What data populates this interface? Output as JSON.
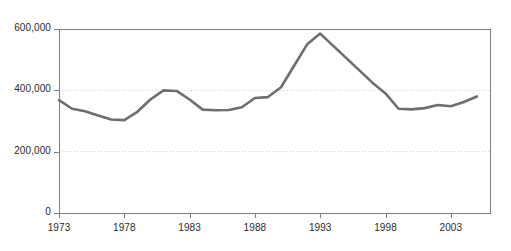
{
  "chart_data": {
    "type": "line",
    "title": "",
    "subtitle": "",
    "xlabel": "",
    "ylabel": "",
    "xlim": [
      1973,
      2006
    ],
    "ylim": [
      0,
      600000
    ],
    "grid": "horizontal-dotted",
    "legend": "none",
    "line_color": "#6e6e6e",
    "axis_color": "#808080",
    "gridline_color": "#cfcfcf",
    "xticks": [
      1973,
      1978,
      1983,
      1988,
      1993,
      1998,
      2003
    ],
    "xtick_labels": [
      "1973",
      "1978",
      "1983",
      "1988",
      "1993",
      "1998",
      "2003"
    ],
    "yticks": [
      0,
      200000,
      400000,
      600000
    ],
    "ytick_labels": [
      "0",
      "200,000",
      "400,000",
      "600,000"
    ],
    "x": [
      1973,
      1974,
      1975,
      1976,
      1977,
      1978,
      1979,
      1980,
      1981,
      1982,
      1983,
      1984,
      1985,
      1986,
      1987,
      1988,
      1989,
      1990,
      1991,
      1992,
      1993,
      1994,
      1995,
      1996,
      1997,
      1998,
      1999,
      2000,
      2001,
      2002,
      2003,
      2004,
      2005
    ],
    "series": [
      {
        "name": "value",
        "values": [
          368000,
          340000,
          332000,
          318000,
          305000,
          303000,
          330000,
          370000,
          400000,
          398000,
          370000,
          337000,
          335000,
          336000,
          345000,
          375000,
          378000,
          410000,
          480000,
          550000,
          585000,
          545000,
          505000,
          465000,
          425000,
          390000,
          340000,
          338000,
          342000,
          352000,
          348000,
          362000,
          380000
        ]
      }
    ]
  },
  "axes_geometry": {
    "plot_left": 59,
    "plot_right": 490,
    "plot_top": 29,
    "plot_bottom": 213
  }
}
